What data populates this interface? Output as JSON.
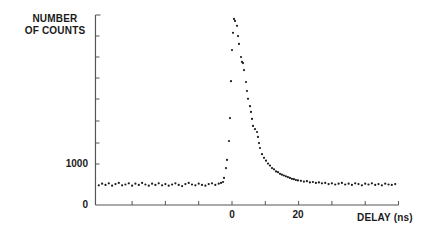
{
  "chart_data": {
    "type": "scatter",
    "title": "",
    "ylabel": "NUMBER OF COUNTS",
    "xlabel": "DELAY (ns)",
    "xlim": [
      -41,
      50
    ],
    "ylim": [
      0,
      4650
    ],
    "grid": false,
    "legend": null,
    "x_ticks": [
      -30,
      -20,
      -10,
      0,
      10,
      20,
      30,
      40,
      50
    ],
    "x_tick_labels": [
      {
        "value": 0,
        "label": "0"
      },
      {
        "value": 20,
        "label": "20"
      }
    ],
    "y_ticks": [
      0,
      1000,
      2000,
      2500,
      3000,
      3500,
      4000,
      4500
    ],
    "y_tick_labels": [
      {
        "value": 0,
        "label": "0"
      },
      {
        "value": 1000,
        "label": "1000"
      }
    ],
    "series": [
      {
        "name": "counts",
        "marker": "dot",
        "color": "#1a1a1a",
        "points": [
          [
            -40,
            480
          ],
          [
            -39,
            520
          ],
          [
            -38,
            490
          ],
          [
            -37,
            530
          ],
          [
            -36,
            470
          ],
          [
            -35,
            510
          ],
          [
            -34,
            540
          ],
          [
            -33,
            480
          ],
          [
            -32,
            500
          ],
          [
            -31,
            530
          ],
          [
            -30,
            470
          ],
          [
            -29,
            520
          ],
          [
            -28,
            490
          ],
          [
            -27,
            540
          ],
          [
            -26,
            500
          ],
          [
            -25,
            470
          ],
          [
            -24,
            520
          ],
          [
            -23,
            490
          ],
          [
            -22,
            530
          ],
          [
            -21,
            480
          ],
          [
            -20,
            510
          ],
          [
            -19,
            470
          ],
          [
            -18,
            500
          ],
          [
            -17,
            530
          ],
          [
            -16,
            490
          ],
          [
            -15,
            460
          ],
          [
            -14,
            510
          ],
          [
            -13,
            540
          ],
          [
            -12,
            500
          ],
          [
            -11,
            480
          ],
          [
            -10,
            520
          ],
          [
            -9,
            490
          ],
          [
            -8,
            470
          ],
          [
            -7,
            510
          ],
          [
            -6,
            530
          ],
          [
            -5,
            490
          ],
          [
            -4,
            520
          ],
          [
            -3.3,
            540
          ],
          [
            -2.7,
            560
          ],
          [
            -2.4,
            660
          ],
          [
            -1.8,
            900
          ],
          [
            -1.5,
            1100
          ],
          [
            -0.9,
            1560
          ],
          [
            -0.6,
            2120
          ],
          [
            -0.3,
            3020
          ],
          [
            0,
            3780
          ],
          [
            0.3,
            4200
          ],
          [
            0.6,
            4540
          ],
          [
            0.9,
            4490
          ],
          [
            1.5,
            4370
          ],
          [
            1.8,
            4120
          ],
          [
            2.1,
            3930
          ],
          [
            2.7,
            3610
          ],
          [
            3.0,
            3490
          ],
          [
            3.3,
            3460
          ],
          [
            3.6,
            3290
          ],
          [
            4.2,
            3000
          ],
          [
            4.5,
            2780
          ],
          [
            4.8,
            2590
          ],
          [
            5.4,
            2410
          ],
          [
            5.7,
            2270
          ],
          [
            6.0,
            2100
          ],
          [
            6.3,
            1930
          ],
          [
            6.9,
            1850
          ],
          [
            7.5,
            1780
          ],
          [
            7.8,
            1660
          ],
          [
            8.1,
            1510
          ],
          [
            8.4,
            1390
          ],
          [
            9.0,
            1240
          ],
          [
            9.6,
            1150
          ],
          [
            10.2,
            1080
          ],
          [
            10.8,
            1010
          ],
          [
            11.4,
            960
          ],
          [
            12.0,
            900
          ],
          [
            12.6,
            870
          ],
          [
            13.2,
            820
          ],
          [
            13.8,
            800
          ],
          [
            14.4,
            760
          ],
          [
            15.0,
            740
          ],
          [
            15.6,
            720
          ],
          [
            16.2,
            700
          ],
          [
            16.8,
            680
          ],
          [
            17.4,
            660
          ],
          [
            18.0,
            640
          ],
          [
            18.6,
            630
          ],
          [
            19.2,
            610
          ],
          [
            19.8,
            600
          ],
          [
            20.7,
            590
          ],
          [
            21.6,
            570
          ],
          [
            22.5,
            580
          ],
          [
            23.4,
            550
          ],
          [
            24.3,
            560
          ],
          [
            25.2,
            540
          ],
          [
            26.1,
            550
          ],
          [
            27.0,
            530
          ],
          [
            28.0,
            540
          ],
          [
            29.0,
            510
          ],
          [
            30.0,
            530
          ],
          [
            31.0,
            500
          ],
          [
            32.0,
            520
          ],
          [
            33.0,
            540
          ],
          [
            34.0,
            500
          ],
          [
            35.0,
            520
          ],
          [
            36.0,
            490
          ],
          [
            37.0,
            530
          ],
          [
            38.0,
            510
          ],
          [
            39.0,
            480
          ],
          [
            40.0,
            520
          ],
          [
            41.0,
            500
          ],
          [
            42.0,
            530
          ],
          [
            43.0,
            490
          ],
          [
            44.0,
            510
          ],
          [
            45.0,
            480
          ],
          [
            46.0,
            520
          ],
          [
            47.0,
            500
          ],
          [
            48.0,
            490
          ],
          [
            49.0,
            510
          ]
        ]
      }
    ]
  },
  "labels": {
    "ylabel_line1": "NUMBER",
    "ylabel_line2": "OF COUNTS",
    "xlabel": "DELAY (ns)",
    "ytick_1000": "1000",
    "ytick_0": "0",
    "xtick_0": "0",
    "xtick_20": "20"
  },
  "style": {
    "ink": "#1a1a1a",
    "axis": "#555555",
    "background": "#ffffff"
  }
}
